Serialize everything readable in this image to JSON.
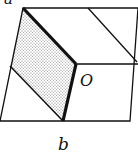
{
  "diagram": {
    "labels": {
      "top_left": "a",
      "center": "O",
      "bottom": "b"
    },
    "colors": {
      "stroke": "#111111",
      "shade": "#cfcfcf",
      "background": "#ffffff"
    }
  }
}
